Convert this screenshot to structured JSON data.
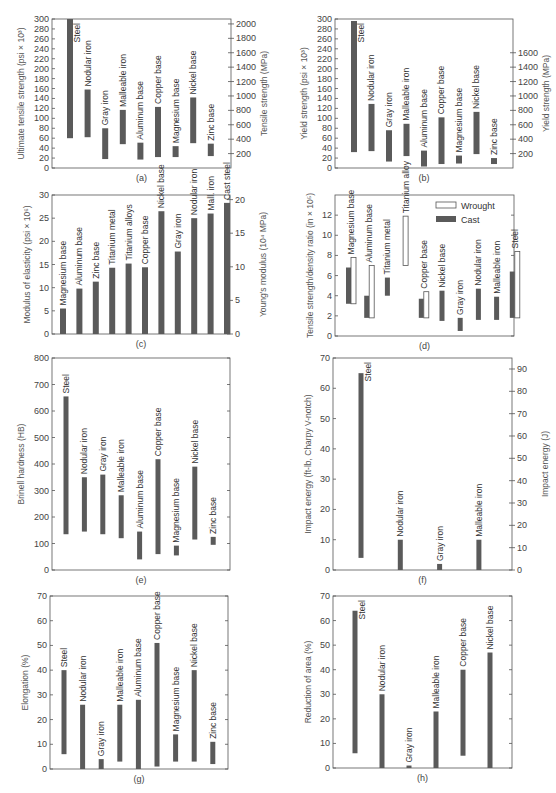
{
  "chart_data": [
    {
      "id": "a",
      "type": "bar",
      "subtype": "range",
      "caption": "(a)",
      "ylabel": "Ultimate tensile strength (psi × 10³)",
      "ylabel_right": "Tensile strength (MPa)",
      "ylim": [
        0,
        300
      ],
      "yticks": [
        0,
        20,
        40,
        60,
        80,
        100,
        120,
        140,
        160,
        180,
        200,
        220,
        240,
        260,
        280,
        300
      ],
      "yticks_right": [
        200,
        400,
        600,
        800,
        1000,
        1200,
        1400,
        1600,
        1800,
        2000
      ],
      "right_factor": 6.895,
      "categories": [
        "Steel",
        "Nodular iron",
        "Gray iron",
        "Malleable iron",
        "Aluminum base",
        "Copper base",
        "Magnesium base",
        "Nickel base",
        "Zinc base"
      ],
      "ranges": [
        [
          60,
          300
        ],
        [
          62,
          158
        ],
        [
          18,
          80
        ],
        [
          48,
          117
        ],
        [
          17,
          51
        ],
        [
          22,
          123
        ],
        [
          22,
          44
        ],
        [
          50,
          142
        ],
        [
          24,
          49
        ]
      ]
    },
    {
      "id": "b",
      "type": "bar",
      "subtype": "range",
      "caption": "(b)",
      "ylabel": "Yield strength (psi × 10³)",
      "ylabel_right": "Yield strength (MPa)",
      "ylim": [
        0,
        300
      ],
      "yticks": [
        0,
        20,
        40,
        60,
        80,
        100,
        120,
        140,
        160,
        180,
        200,
        220,
        240,
        260,
        280,
        300
      ],
      "yticks_right": [
        200,
        400,
        600,
        800,
        1000,
        1200,
        1400,
        1600
      ],
      "right_factor": 6.895,
      "categories": [
        "Steel",
        "Nodular iron",
        "Gray iron",
        "Malleable iron",
        "Aluminum base",
        "Copper base",
        "Magnesium base",
        "Nickel base",
        "Zinc base"
      ],
      "ranges": [
        [
          32,
          296
        ],
        [
          34,
          129
        ],
        [
          13,
          76
        ],
        [
          24,
          89
        ],
        [
          3,
          35
        ],
        [
          8,
          102
        ],
        [
          9,
          25
        ],
        [
          28,
          113
        ],
        [
          8,
          20
        ]
      ]
    },
    {
      "id": "c",
      "type": "bar",
      "caption": "(c)",
      "ylabel": "Modulus of elasticity (psi × 10⁶)",
      "ylabel_right": "Young's modulus (10⁴ MPa)",
      "ylim": [
        0,
        30
      ],
      "yticks": [
        0,
        5,
        10,
        15,
        20,
        25,
        30
      ],
      "yticks_right": [
        0,
        5,
        10,
        15,
        20
      ],
      "right_factor": 0.6895,
      "categories": [
        "Magnesium base",
        "Aluminum base",
        "Zinc base",
        "Titanium metal",
        "Titanium alloys",
        "Copper base",
        "Nickel base",
        "Gray iron",
        "Nodular iron",
        "Mall. iron",
        "Cast steel"
      ],
      "values": [
        5.5,
        9.8,
        11.3,
        14.3,
        15.2,
        14.4,
        26.5,
        17.8,
        25.0,
        26.0,
        28.3
      ]
    },
    {
      "id": "d",
      "type": "bar",
      "subtype": "range-grouped",
      "caption": "(d)",
      "ylabel": "Tensile strength/density ratio (in × 10⁵)",
      "ylim": [
        0,
        14
      ],
      "yticks": [
        0,
        2,
        4,
        6,
        8,
        10,
        12
      ],
      "legend": [
        {
          "name": "Wrought",
          "style": "open"
        },
        {
          "name": "Cast",
          "style": "filled"
        }
      ],
      "legend_position": "upper right",
      "categories": [
        "Magnesium base",
        "Aluminum base",
        "Titanium metal",
        "Titanium alloy",
        "Copper base",
        "Nickel base",
        "Gray iron",
        "Nodular iron",
        "Malleable iron",
        "Steel"
      ],
      "series": [
        {
          "name": "Cast",
          "ranges": [
            [
              3.2,
              6.8
            ],
            [
              1.8,
              4.0
            ],
            [
              4.0,
              5.8
            ],
            null,
            [
              1.8,
              3.7
            ],
            [
              1.5,
              4.5
            ],
            [
              0.5,
              1.8
            ],
            [
              1.6,
              4.7
            ],
            [
              1.6,
              3.9
            ],
            [
              1.8,
              6.4
            ]
          ]
        },
        {
          "name": "Wrought",
          "ranges": [
            [
              3.2,
              7.8
            ],
            [
              1.8,
              7.0
            ],
            null,
            [
              7.0,
              11.9
            ],
            [
              1.8,
              4.4
            ],
            null,
            null,
            null,
            null,
            [
              1.8,
              8.4
            ]
          ]
        }
      ]
    },
    {
      "id": "e",
      "type": "bar",
      "subtype": "range",
      "caption": "(e)",
      "ylabel": "Brinell hardness (HB)",
      "ylim": [
        0,
        800
      ],
      "yticks": [
        0,
        100,
        200,
        300,
        400,
        500,
        600,
        700,
        800
      ],
      "categories": [
        "Steel",
        "Nodular iron",
        "Gray iron",
        "Malleable iron",
        "Aluminum base",
        "Copper base",
        "Magnesium base",
        "Nickel base",
        "Zinc base"
      ],
      "ranges": [
        [
          135,
          655
        ],
        [
          145,
          350
        ],
        [
          135,
          360
        ],
        [
          120,
          282
        ],
        [
          40,
          145
        ],
        [
          60,
          418
        ],
        [
          55,
          92
        ],
        [
          115,
          390
        ],
        [
          95,
          125
        ]
      ]
    },
    {
      "id": "f",
      "type": "bar",
      "subtype": "range",
      "caption": "(f)",
      "ylabel": "Impact energy (ft-lb, Charpy V-notch)",
      "ylabel_right": "Impact energy (J)",
      "ylim": [
        0,
        70
      ],
      "yticks": [
        0,
        10,
        20,
        30,
        40,
        50,
        60,
        70
      ],
      "yticks_right": [
        0,
        10,
        20,
        30,
        40,
        50,
        60,
        70,
        80,
        90
      ],
      "right_factor": 1.356,
      "categories": [
        "Steel",
        "Nodular iron",
        "Gray iron",
        "Malleable iron"
      ],
      "ranges": [
        [
          4,
          65
        ],
        [
          0,
          10
        ],
        [
          0,
          2
        ],
        [
          0,
          10
        ]
      ]
    },
    {
      "id": "g",
      "type": "bar",
      "subtype": "range",
      "caption": "(g)",
      "ylabel": "Elongation (%)",
      "ylim": [
        0,
        70
      ],
      "yticks": [
        0,
        10,
        20,
        30,
        40,
        50,
        60,
        70
      ],
      "categories": [
        "Steel",
        "Nodular iron",
        "Gray iron",
        "Malleable iron",
        "Aluminum base",
        "Copper base",
        "Magnesium base",
        "Nickel base",
        "Zinc base"
      ],
      "ranges": [
        [
          6,
          40
        ],
        [
          0,
          26
        ],
        [
          0,
          4
        ],
        [
          3,
          26
        ],
        [
          0,
          28
        ],
        [
          1,
          51
        ],
        [
          3,
          14
        ],
        [
          3,
          40
        ],
        [
          2,
          11
        ]
      ]
    },
    {
      "id": "h",
      "type": "bar",
      "subtype": "range",
      "caption": "(h)",
      "ylabel": "Reduction of area (%)",
      "ylim": [
        0,
        70
      ],
      "yticks": [
        0,
        10,
        20,
        30,
        40,
        50,
        60,
        70
      ],
      "categories": [
        "Steel",
        "Nodular iron",
        "Gray iron",
        "Malleable iron",
        "Copper base",
        "Nickel base"
      ],
      "ranges": [
        [
          6,
          64
        ],
        [
          0,
          30
        ],
        [
          0,
          1
        ],
        [
          0,
          23
        ],
        [
          5,
          40
        ],
        [
          0,
          47
        ]
      ]
    }
  ]
}
